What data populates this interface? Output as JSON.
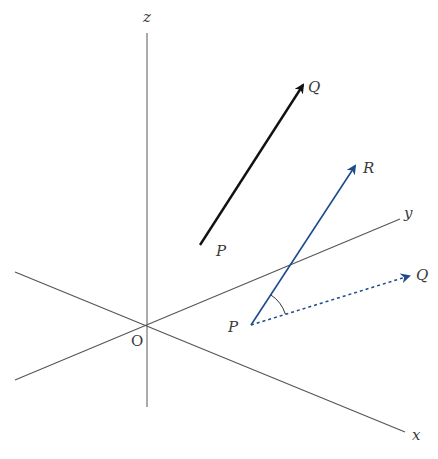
{
  "diagram": {
    "type": "3d-coordinate-vectors",
    "colors": {
      "axis": "#555555",
      "black_vector": "#111111",
      "blue_vector": "#1f4a8c",
      "label": "#3a3a3a"
    },
    "axes": {
      "origin": {
        "label": "O",
        "x": 147,
        "y": 326
      },
      "z": {
        "label": "z",
        "x1": 147,
        "y1": 33,
        "x2": 147,
        "y2": 407,
        "label_x": 143,
        "label_y": 22
      },
      "y": {
        "label": "y",
        "x1": 15,
        "y1": 380,
        "x2": 400,
        "y2": 219,
        "label_x": 404,
        "label_y": 218
      },
      "x": {
        "label": "x",
        "x1": 15,
        "y1": 272,
        "x2": 405,
        "y2": 432,
        "label_x": 412,
        "label_y": 440
      }
    },
    "vector_pq_black": {
      "start_label": "P",
      "end_label": "Q",
      "x1": 200,
      "y1": 245,
      "x2": 305,
      "y2": 82,
      "start_label_x": 216,
      "start_label_y": 256,
      "end_label_x": 308,
      "end_label_y": 92
    },
    "vector_pr_blue": {
      "start_label": "P",
      "end_label": "R",
      "x1": 251,
      "y1": 325,
      "x2": 357,
      "y2": 163,
      "start_label_x": 228,
      "start_label_y": 332,
      "end_label_x": 363,
      "end_label_y": 173
    },
    "vector_pq_blue_dotted": {
      "end_label": "Q",
      "x1": 251,
      "y1": 325,
      "x2": 412,
      "y2": 275,
      "end_label_x": 416,
      "end_label_y": 280
    },
    "angle_arc": {
      "cx": 251,
      "cy": 325,
      "r": 36
    }
  }
}
